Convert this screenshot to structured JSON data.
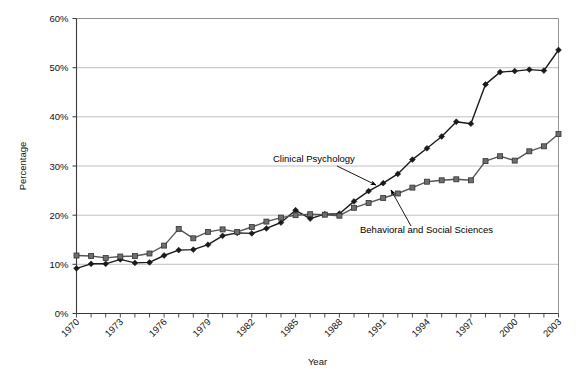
{
  "chart_data": {
    "type": "line",
    "title": "",
    "xlabel": "Year",
    "ylabel": "Percentage",
    "xlim": [
      1970,
      2003
    ],
    "ylim": [
      0,
      60
    ],
    "ytick_labels": [
      "0%",
      "10%",
      "20%",
      "30%",
      "40%",
      "50%",
      "60%"
    ],
    "ytick_values": [
      0,
      10,
      20,
      30,
      40,
      50,
      60
    ],
    "xtick_labels": [
      "1970",
      "1973",
      "1976",
      "1979",
      "1982",
      "1985",
      "1988",
      "1991",
      "1994",
      "1997",
      "2000",
      "2003"
    ],
    "xtick_values": [
      1970,
      1973,
      1976,
      1979,
      1982,
      1985,
      1988,
      1991,
      1994,
      1997,
      2000,
      2003
    ],
    "x": [
      1970,
      1971,
      1972,
      1973,
      1974,
      1975,
      1976,
      1977,
      1978,
      1979,
      1980,
      1981,
      1982,
      1983,
      1984,
      1985,
      1986,
      1987,
      1988,
      1989,
      1990,
      1991,
      1992,
      1993,
      1994,
      1995,
      1996,
      1997,
      1998,
      1999,
      2000,
      2001,
      2002,
      2003
    ],
    "grid": "horizontal",
    "legend_position": "inline-annotations",
    "series": [
      {
        "name": "Clinical Psychology",
        "marker": "diamond",
        "color": "#1a1a1a",
        "values": [
          9.2,
          10.1,
          10.1,
          11.0,
          10.3,
          10.4,
          11.8,
          12.9,
          13.0,
          14.0,
          15.8,
          16.4,
          16.3,
          17.3,
          18.5,
          21.0,
          19.3,
          20.2,
          20.3,
          22.8,
          24.9,
          26.5,
          28.4,
          31.3,
          33.6,
          36.0,
          39.0,
          38.6,
          46.6,
          49.1,
          49.3,
          49.6,
          49.4,
          53.6
        ]
      },
      {
        "name": "Behavioral and Social Sciences",
        "marker": "square",
        "color": "#555555",
        "values": [
          11.8,
          11.7,
          11.3,
          11.6,
          11.7,
          12.2,
          13.8,
          17.2,
          15.3,
          16.6,
          17.1,
          16.6,
          17.6,
          18.7,
          19.5,
          20.0,
          20.2,
          20.1,
          19.9,
          21.5,
          22.5,
          23.5,
          24.4,
          25.6,
          26.8,
          27.1,
          27.3,
          27.1,
          31.0,
          32.0,
          31.1,
          33.0,
          34.0,
          36.5
        ]
      }
    ],
    "annotations": [
      {
        "text": "Clinical Psychology",
        "label_x": 273,
        "label_y": 162,
        "arrow_from_x": 337,
        "arrow_from_y": 166,
        "arrow_to_x": 376,
        "arrow_to_y": 185
      },
      {
        "text": "Behavioral and Social Sciences",
        "label_x": 360,
        "label_y": 233,
        "arrow_from_x": 411,
        "arrow_from_y": 226,
        "arrow_to_x": 391,
        "arrow_to_y": 190
      }
    ]
  }
}
